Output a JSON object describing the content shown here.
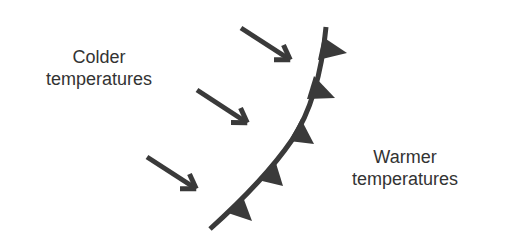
{
  "diagram": {
    "type": "cold-front",
    "colors": {
      "front": "#3a3a3a",
      "arrow": "#3a3a3a",
      "text": "#333333",
      "background": "#ffffff"
    },
    "labels": {
      "cold": {
        "line1": "Colder",
        "line2": "temperatures"
      },
      "warm": {
        "line1": "Warmer",
        "line2": "temperatures"
      }
    },
    "front_line": {
      "path": "M326,27 C322,70 312,110 292,140 C270,172 240,202 210,229"
    },
    "front_triangles": [
      {
        "points": "323,37 318,60 347,53"
      },
      {
        "points": "314,76 307,99 335,98"
      },
      {
        "points": "301,119 289,141 314,144"
      },
      {
        "points": "275,160 258,180 283,186"
      },
      {
        "points": "243,197 228,213 252,221"
      }
    ],
    "arrows": [
      {
        "x1": 241,
        "y1": 28,
        "x2": 289,
        "y2": 59
      },
      {
        "x1": 197,
        "y1": 90,
        "x2": 246,
        "y2": 122
      },
      {
        "x1": 147,
        "y1": 157,
        "x2": 195,
        "y2": 188
      }
    ]
  }
}
